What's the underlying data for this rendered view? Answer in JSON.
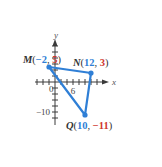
{
  "chart_data": {
    "type": "scatter",
    "title": "",
    "xlabel": "x",
    "ylabel": "y",
    "xlim": [
      -6,
      16
    ],
    "ylim": [
      -13,
      13
    ],
    "tick_step": 2,
    "tick_labels": [
      {
        "axis": "origin",
        "value": 0,
        "text": "0"
      },
      {
        "axis": "x",
        "value": 6,
        "text": "6"
      },
      {
        "axis": "y",
        "value": -10,
        "text": "−10"
      }
    ],
    "points": [
      {
        "name": "M",
        "x": -2,
        "y": 5,
        "x_text": "−2",
        "y_text": "5"
      },
      {
        "name": "N",
        "x": 12,
        "y": 3,
        "x_text": "12",
        "y_text": "3"
      },
      {
        "name": "Q",
        "x": 10,
        "y": -11,
        "x_text": "10",
        "y_text": "−11"
      }
    ],
    "polygon": [
      "M",
      "N",
      "Q"
    ],
    "colors": {
      "triangle": "#2f7fd6",
      "x_coordinate": "#2f7fd6",
      "y_coordinate": "#d0392f",
      "axes": "#3a3a3a"
    },
    "grid": false
  }
}
